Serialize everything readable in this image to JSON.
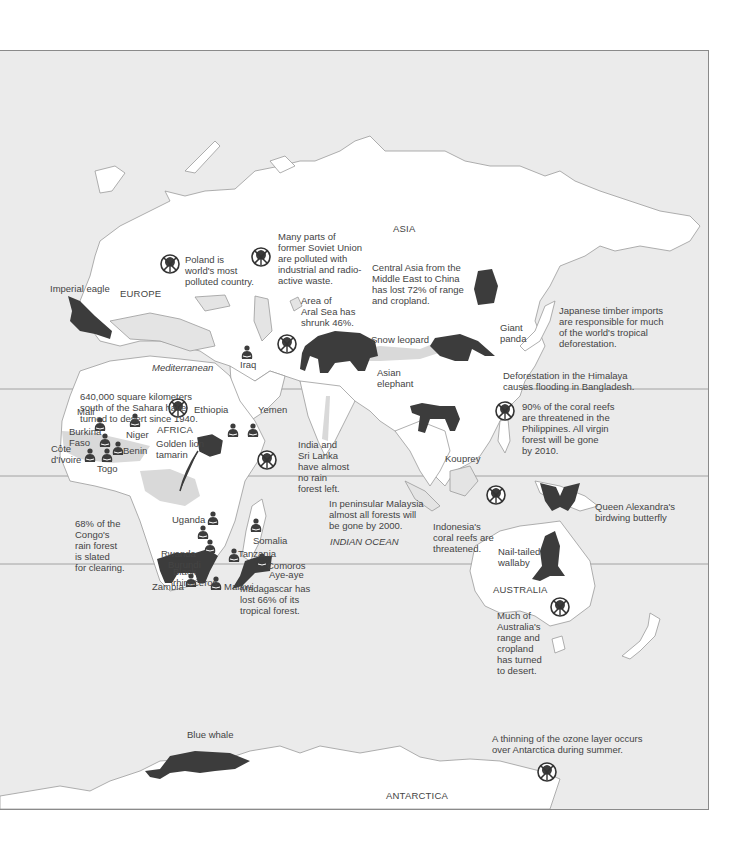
{
  "map": {
    "colors": {
      "ocean": "#ebebeb",
      "land": "#ffffff",
      "coast": "#9a9a9a",
      "silhouette": "#3c3c3c",
      "degraded_land": "#d6d6d6",
      "text": "#444444"
    },
    "regions": {
      "europe": "EUROPE",
      "asia": "ASIA",
      "africa": "AFRICA",
      "australia": "AUSTRALIA",
      "antarctica": "ANTARCTICA"
    },
    "water": {
      "mediterranean": "Mediterranean",
      "indian_ocean": "INDIAN OCEAN"
    },
    "species": {
      "imperial_eagle": "Imperial eagle",
      "giant_panda": "Giant\npanda",
      "snow_leopard": "Snow leopard",
      "asian_elephant": "Asian\nelephant",
      "kouprey": "Kouprey",
      "golden_lion_tamarin": "Golden lion\ntamarin",
      "black_rhinoceros": "Black\nrhinoceros",
      "aye_aye": "Aye-aye",
      "nail_tailed_wallaby": "Nail-tailed\nwallaby",
      "birdwing_butterfly": "Queen Alexandra's\nbirdwing butterfly",
      "blue_whale": "Blue whale"
    },
    "countries": {
      "iraq": "Iraq",
      "mali": "Mali",
      "burkina_faso": "Burkina\nFaso",
      "niger": "Niger",
      "cote_divoire": "Côte\nd'Ivoire",
      "benin": "Benin",
      "togo": "Togo",
      "ethiopia": "Ethiopia",
      "yemen": "Yemen",
      "uganda": "Uganda",
      "somalia": "Somalia",
      "rwanda": "Rwanda",
      "burundi": "Burundi",
      "tanzania": "Tanzania",
      "comoros": "Comoros",
      "zambia": "Zambia",
      "malawi": "Malawi"
    },
    "notes": {
      "poland": "Poland is\nworld's most\npolluted country.",
      "soviet_union": "Many parts of\nformer Soviet Union\nare polluted with\nindustrial and radio-\nactive waste.",
      "aral_sea": "Area of\nAral Sea has\nshrunk 46%.",
      "central_asia": "Central Asia from the\nMiddle East to China\nhas lost 72% of range\nand cropland.",
      "japanese_timber": "Japanese timber imports\nare responsible for much\nof the world's tropical\ndeforestation.",
      "himalaya": "Deforestation in the Himalaya\ncauses flooding in Bangladesh.",
      "sahara": "640,000 square kilometers\nsouth of the Sahara have\nturned to desert since 1940.",
      "india": "India and\nSri Lanka\nhave almost\nno rain\nforest left.",
      "philippines": "90% of the coral reefs\nare threatened in the\nPhilippines. All virgin\nforest will be gone\nby 2010.",
      "congo": "68% of the\nCongo's\nrain forest\nis slated\nfor clearing.",
      "malaysia": "In peninsular Malaysia\nalmost all forests will\nbe gone by 2000.",
      "indonesia": "Indonesia's\ncoral reefs are\nthreatened.",
      "madagascar": "Madagascar has\nlost 66% of its\ntropical forest.",
      "australia": "Much of\nAustralia's\nrange and\ncropland\nhas turned\nto desert.",
      "ozone": "A thinning of the ozone layer occurs\nover Antarctica during summer."
    },
    "icons": {
      "environmental_damage": "crossed-out-tree-icon",
      "starvation": "seated-person-icon",
      "endangered_species": "animal-silhouette-icon"
    }
  }
}
